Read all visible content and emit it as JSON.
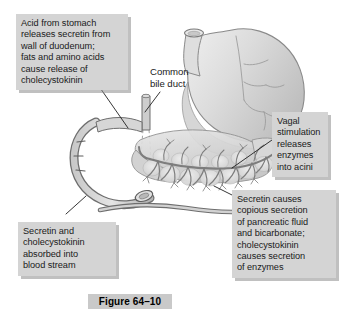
{
  "figure": {
    "caption": "Figure 64–10"
  },
  "callouts": {
    "acid_stomach": "Acid from stomach\nreleases secretin from\nwall of duodenum;\nfats and amino acids\ncause release of\ncholecystokinin",
    "common_bile_duct": "Common\nbile duct",
    "vagal": "Vagal\nstimulation\nreleases\nenzymes\ninto acini",
    "secretin_pancreas": "Secretin causes\ncopious secretion\nof pancreatic fluid\nand bicarbonate;\ncholecystokinin\ncauses secretion\nof enzymes",
    "absorbed_blood": "Secretin and\ncholecystokinin\nabsorbed into\nblood stream"
  },
  "anatomy": {
    "stomach": "stomach",
    "esophagus": "esophagus",
    "duodenum": "duodenum",
    "pancreas": "pancreas",
    "pancreatic_duct": "pancreatic-duct",
    "common_bile_duct": "common-bile-duct",
    "acini": "acini"
  },
  "colors": {
    "callout_background": "#d4d4d4",
    "callout_shadow": "#8c8c8c",
    "caption_background": "#c9c9c9",
    "text": "#1a1a1a",
    "organ_fill_light": "#dcdcdc",
    "organ_fill_mid": "#c6c6c6",
    "organ_fill_dark": "#ababab",
    "outline": "#6e6e6e",
    "outline_dark": "#555555",
    "leader_line": "#222222",
    "page_background": "#ffffff"
  }
}
